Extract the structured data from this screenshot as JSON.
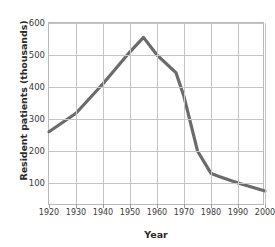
{
  "chart_data": {
    "type": "line",
    "title": "",
    "xlabel": "Year",
    "ylabel": "Resident patients (thousands)",
    "xlim": [
      1920,
      2000
    ],
    "ylim": [
      28,
      600
    ],
    "grid": true,
    "legend": null,
    "line_color": "#6b6b6b",
    "grid_color": "#c4c4c4",
    "frame_color": "#b9b9b9",
    "xticks": [
      1920,
      1930,
      1940,
      1950,
      1960,
      1970,
      1980,
      1990,
      2000
    ],
    "xtick_labels": [
      "1920",
      "1930",
      "1940",
      "1950",
      "1960",
      "1970",
      "1980",
      "1990",
      "2000"
    ],
    "yticks": [
      100,
      200,
      300,
      400,
      500,
      600
    ],
    "ytick_labels": [
      "100",
      "200",
      "300",
      "400",
      "500",
      "600"
    ],
    "x": [
      1920,
      1930,
      1940,
      1950,
      1955,
      1960,
      1967,
      1970,
      1975,
      1980,
      1983,
      1990,
      2000
    ],
    "values": [
      260,
      318,
      410,
      510,
      555,
      500,
      445,
      370,
      200,
      130,
      120,
      100,
      75
    ],
    "series": [
      {
        "name": "Resident patients",
        "x": [
          1920,
          1930,
          1940,
          1950,
          1955,
          1960,
          1967,
          1970,
          1975,
          1980,
          1983,
          1990,
          2000
        ],
        "values": [
          260,
          318,
          410,
          510,
          555,
          500,
          445,
          370,
          200,
          130,
          120,
          100,
          75
        ]
      }
    ],
    "peak": {
      "year": 1955,
      "value": 555
    }
  }
}
